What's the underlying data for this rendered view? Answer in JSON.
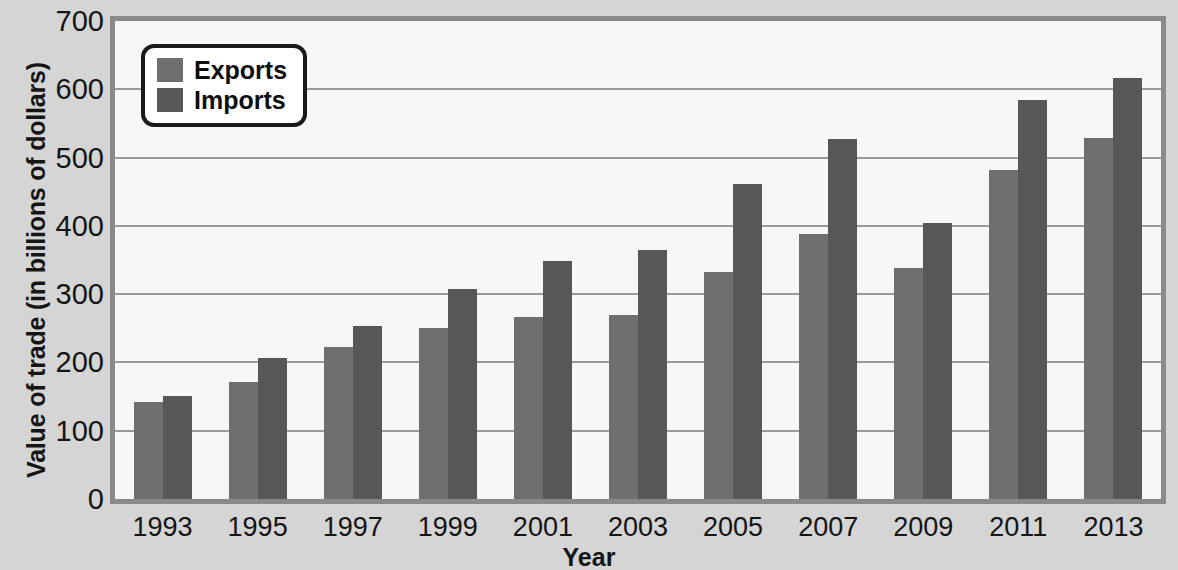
{
  "chart_data": {
    "type": "bar",
    "title": "",
    "xlabel": "Year",
    "ylabel": "Value of trade (in billions of dollars)",
    "categories": [
      "1993",
      "1995",
      "1997",
      "1999",
      "2001",
      "2003",
      "2005",
      "2007",
      "2009",
      "2011",
      "2013"
    ],
    "series": [
      {
        "name": "Exports",
        "color": "#6f6f6f",
        "values": [
          142,
          172,
          222,
          251,
          266,
          269,
          333,
          388,
          338,
          482,
          529
        ]
      },
      {
        "name": "Imports",
        "color": "#575757",
        "values": [
          151,
          207,
          254,
          308,
          349,
          364,
          461,
          527,
          404,
          584,
          617
        ]
      }
    ],
    "ylim": [
      0,
      700
    ],
    "ytick_values": [
      0,
      100,
      200,
      300,
      400,
      500,
      600,
      700
    ],
    "ytick_labels": [
      "0",
      "100",
      "200",
      "300",
      "400",
      "500",
      "600",
      "700"
    ],
    "grid": true,
    "legend_position": "top-left",
    "plot_background": "#f7f7f7",
    "figure_background": "#d5d5d5",
    "axis_border_color": "#8a8a8a",
    "gridline_color": "#9a9a9a"
  }
}
